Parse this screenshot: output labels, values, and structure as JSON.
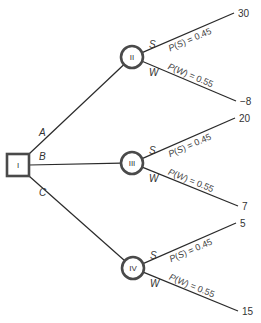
{
  "diagram": {
    "type": "decision-tree",
    "decision_node": {
      "id": "I",
      "label": "I",
      "x": 18,
      "y": 165,
      "size": 22
    },
    "chance_nodes": [
      {
        "id": "II",
        "label": "II",
        "x": 132,
        "y": 57,
        "r": 11,
        "incoming_branch": "A",
        "outcomes": [
          {
            "label": "S",
            "prob_text": "P(S) = 0.45",
            "prob_var": "S",
            "prob": "0.45",
            "payoff": "30",
            "end_x": 234,
            "end_y": 13
          },
          {
            "label": "W",
            "prob_text": "P(W) = 0.55",
            "prob_var": "W",
            "prob": "0.55",
            "payoff": "−8",
            "end_x": 236,
            "end_y": 101
          }
        ]
      },
      {
        "id": "III",
        "label": "III",
        "x": 132,
        "y": 163,
        "r": 11,
        "incoming_branch": "B",
        "outcomes": [
          {
            "label": "S",
            "prob_text": "P(S) = 0.45",
            "prob_var": "S",
            "prob": "0.45",
            "payoff": "20",
            "end_x": 235,
            "end_y": 118
          },
          {
            "label": "W",
            "prob_text": "P(W) = 0.55",
            "prob_var": "W",
            "prob": "0.55",
            "payoff": "7",
            "end_x": 238,
            "end_y": 206
          }
        ]
      },
      {
        "id": "IV",
        "label": "IV",
        "x": 133,
        "y": 268,
        "r": 11,
        "incoming_branch": "C",
        "outcomes": [
          {
            "label": "S",
            "prob_text": "P(S) = 0.45",
            "prob_var": "S",
            "prob": "0.45",
            "payoff": "5",
            "end_x": 236,
            "end_y": 223
          },
          {
            "label": "W",
            "prob_text": "P(W) = 0.55",
            "prob_var": "W",
            "prob": "0.55",
            "payoff": "15",
            "end_x": 238,
            "end_y": 311
          }
        ]
      }
    ],
    "decision_branches": [
      {
        "label": "A",
        "to": "II",
        "label_x": 39,
        "label_y": 136
      },
      {
        "label": "B",
        "to": "III",
        "label_x": 39,
        "label_y": 160
      },
      {
        "label": "C",
        "to": "IV",
        "label_x": 39,
        "label_y": 196
      }
    ],
    "colors": {
      "line": "#2a2a2a",
      "node_stroke": "#4a4a4a",
      "text": "#333333"
    }
  }
}
